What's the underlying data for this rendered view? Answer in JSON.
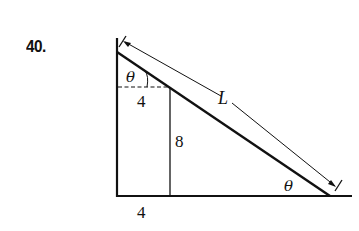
{
  "problem": {
    "number": "40."
  },
  "diagram": {
    "labels": {
      "theta_top": "θ",
      "theta_bottom": "θ",
      "top_horizontal": "4",
      "vertical": "8",
      "bottom_horizontal": "4",
      "hypotenuse": "L"
    },
    "colors": {
      "stroke": "#111111",
      "background": "#ffffff"
    }
  }
}
